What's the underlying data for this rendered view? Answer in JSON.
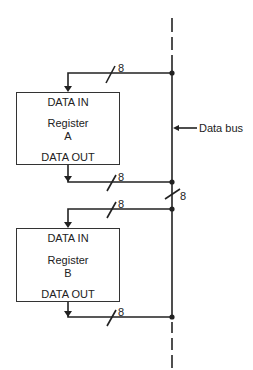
{
  "diagram": {
    "bus_label": "Data bus",
    "bus_width_label": "8",
    "registers": [
      {
        "name": "Register",
        "id": "A",
        "in_label": "DATA IN",
        "out_label": "DATA OUT",
        "in_width": "8",
        "out_width": "8"
      },
      {
        "name": "Register",
        "id": "B",
        "in_label": "DATA IN",
        "out_label": "DATA OUT",
        "in_width": "8",
        "out_width": "8"
      }
    ],
    "colors": {
      "line": "#222222",
      "background": "#ffffff"
    }
  }
}
